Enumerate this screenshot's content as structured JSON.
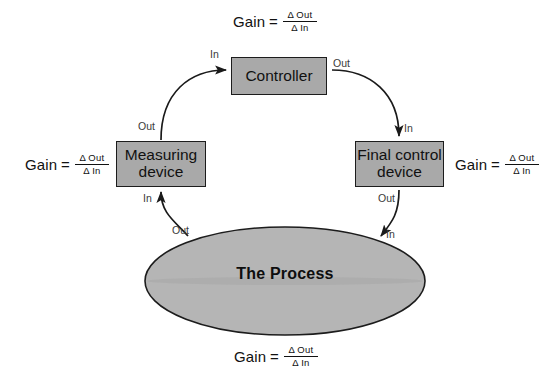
{
  "diagram": {
    "background_color": "#ffffff",
    "box_fill_color": "#a9a9a9",
    "box_border_color": "#1c1c1c",
    "ellipse_fill_color": "#b5b5b5",
    "line_color": "#1a1a1a"
  },
  "gain_formula": {
    "label": "Gain",
    "equals": "=",
    "numerator": "Δ Out",
    "denominator": "Δ In"
  },
  "nodes": {
    "controller": {
      "label": "Controller"
    },
    "measuring_device": {
      "line1": "Measuring",
      "line2": "device"
    },
    "final_control_device": {
      "line1": "Final control",
      "line2": "device"
    },
    "process": {
      "label": "The Process"
    }
  },
  "ports": {
    "controller_in": "In",
    "controller_out": "Out",
    "measuring_out": "Out",
    "measuring_in": "In",
    "final_in": "In",
    "final_out": "Out",
    "process_out": "Out",
    "process_in": "In"
  },
  "gain_labels": {
    "top": "controller-gain",
    "left": "measuring-device-gain",
    "right": "final-control-device-gain",
    "bottom": "process-gain"
  }
}
